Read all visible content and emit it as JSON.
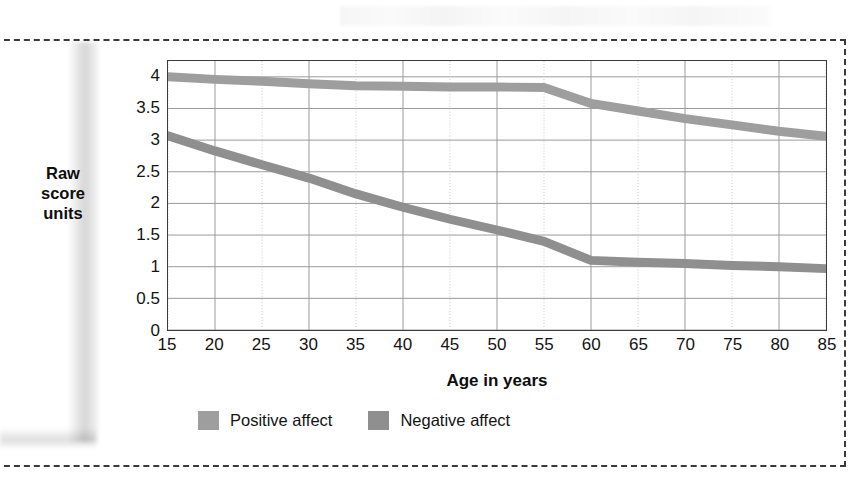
{
  "figure": {
    "background_color": "#ffffff",
    "frame_style": "dashed",
    "frame_color": "#3a3a3a"
  },
  "axis_titles": {
    "y_line1": "Raw",
    "y_line2": "score",
    "y_line3": "units",
    "x": "Age in years"
  },
  "legend": {
    "items": [
      {
        "label": "Positive affect",
        "color": "#9e9e9e"
      },
      {
        "label": "Negative affect",
        "color": "#8f8f8f"
      }
    ]
  },
  "chart_data": {
    "type": "line",
    "title": "",
    "xlabel": "Age in years",
    "ylabel": "Raw score units",
    "xlim": [
      15,
      85
    ],
    "ylim": [
      0,
      4.25
    ],
    "yticks": [
      0,
      0.5,
      1,
      1.5,
      2,
      2.5,
      3,
      3.5,
      4
    ],
    "ytick_labels": [
      "0",
      "0.5",
      "1",
      "1.5",
      "2",
      "2.5",
      "3",
      "3.5",
      "4"
    ],
    "xticks": [
      15,
      20,
      25,
      30,
      35,
      40,
      45,
      50,
      55,
      60,
      65,
      70,
      75,
      80,
      85
    ],
    "xtick_labels": [
      "15",
      "20",
      "25",
      "30",
      "35",
      "40",
      "45",
      "50",
      "55",
      "60",
      "65",
      "70",
      "75",
      "80",
      "85"
    ],
    "grid": "both",
    "grid_color_major": "#9a9a9a",
    "grid_color_minor": "#c9c9c9",
    "legend_position": "below-axes",
    "line_width_px": 9,
    "series": [
      {
        "name": "Positive affect",
        "color": "#9e9e9e",
        "x": [
          15,
          20,
          25,
          30,
          35,
          40,
          45,
          50,
          55,
          60,
          65,
          70,
          75,
          80,
          85
        ],
        "values": [
          4.0,
          3.96,
          3.93,
          3.89,
          3.86,
          3.85,
          3.84,
          3.84,
          3.83,
          3.58,
          3.46,
          3.34,
          3.24,
          3.14,
          3.06
        ]
      },
      {
        "name": "Negative affect",
        "color": "#8f8f8f",
        "x": [
          15,
          20,
          25,
          30,
          35,
          40,
          45,
          50,
          55,
          60,
          65,
          70,
          75,
          80,
          85
        ],
        "values": [
          3.07,
          2.83,
          2.61,
          2.4,
          2.15,
          1.94,
          1.75,
          1.58,
          1.4,
          1.1,
          1.07,
          1.05,
          1.02,
          1.0,
          0.97
        ]
      }
    ]
  }
}
